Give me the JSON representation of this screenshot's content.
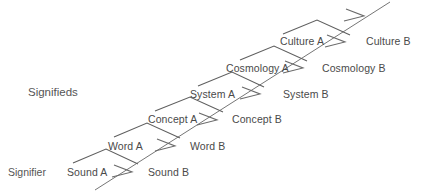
{
  "diagram": {
    "stroke_color": "#6e6e6e",
    "text_color": "#4a4a4a",
    "background": "#ffffff",
    "axis_labels": [
      {
        "name": "signifieds",
        "text": "Signifieds",
        "x": 28,
        "y": 86
      },
      {
        "name": "signifier",
        "text": "Signifier",
        "x": 8,
        "y": 166
      }
    ],
    "levels": [
      {
        "index": 0,
        "tier": "sound",
        "left": {
          "text": "Sound A",
          "x": 67,
          "y": 166
        },
        "right": {
          "text": "Sound B",
          "x": 148,
          "y": 166
        }
      },
      {
        "index": 1,
        "tier": "word",
        "left": {
          "text": "Word A",
          "x": 108,
          "y": 140
        },
        "right": {
          "text": "Word B",
          "x": 190,
          "y": 140
        }
      },
      {
        "index": 2,
        "tier": "concept",
        "left": {
          "text": "Concept A",
          "x": 148,
          "y": 113
        },
        "right": {
          "text": "Concept B",
          "x": 232,
          "y": 113
        }
      },
      {
        "index": 3,
        "tier": "system",
        "left": {
          "text": "System A",
          "x": 190,
          "y": 88
        },
        "right": {
          "text": "System B",
          "x": 283,
          "y": 88
        }
      },
      {
        "index": 4,
        "tier": "cosmology",
        "left": {
          "text": "Cosmology A",
          "x": 226,
          "y": 62
        },
        "right": {
          "text": "Cosmology B",
          "x": 322,
          "y": 62
        }
      },
      {
        "index": 5,
        "tier": "culture",
        "left": {
          "text": "Culture A",
          "x": 280,
          "y": 35
        },
        "right": {
          "text": "Culture B",
          "x": 366,
          "y": 35
        }
      }
    ],
    "arrow_markers": [
      {
        "name": "arrow-sound",
        "x": 120,
        "y": 170
      },
      {
        "name": "arrow-word",
        "x": 163,
        "y": 144
      },
      {
        "name": "arrow-concept",
        "x": 205,
        "y": 118
      },
      {
        "name": "arrow-system",
        "x": 248,
        "y": 92
      },
      {
        "name": "arrow-cosmology",
        "x": 291,
        "y": 66
      },
      {
        "name": "arrow-culture",
        "x": 333,
        "y": 40
      },
      {
        "name": "arrow-top",
        "x": 352,
        "y": 14
      }
    ],
    "diagonal": {
      "name": "signification-axis",
      "from_x": 95,
      "from_y": 190,
      "to_x": 390,
      "to_y": 2
    }
  }
}
